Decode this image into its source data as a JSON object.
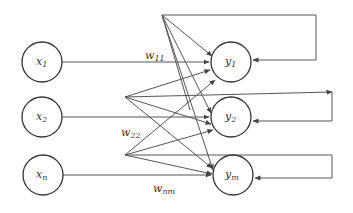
{
  "diagram": {
    "type": "single-layer recurrent neural network",
    "input_nodes": [
      {
        "id": "x1",
        "base": "x",
        "sub": "1"
      },
      {
        "id": "x2",
        "base": "x",
        "sub": "2"
      },
      {
        "id": "xn",
        "base": "x",
        "sub": "n"
      }
    ],
    "output_nodes": [
      {
        "id": "y1",
        "base": "y",
        "sub": "1"
      },
      {
        "id": "y2",
        "base": "y",
        "sub": "2"
      },
      {
        "id": "ym",
        "base": "y",
        "sub": "m"
      }
    ],
    "weight_labels": [
      {
        "base": "w",
        "sub": "11"
      },
      {
        "base": "w",
        "sub": "22"
      },
      {
        "base": "w",
        "sub": "nm"
      }
    ],
    "feedback_loops": [
      "y1",
      "y2",
      "ym"
    ],
    "line_color": "#555555",
    "node_stroke_color": "#333333"
  }
}
